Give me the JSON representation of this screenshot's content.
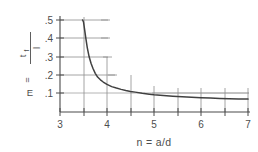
{
  "chart_data": {
    "type": "line",
    "title": "",
    "xlabel": "n = a/d",
    "ylabel": "E = t_f / l",
    "ylabel_parts": {
      "lhs": "E",
      "equals": "=",
      "numerator": "t",
      "numerator_sub": "f",
      "denominator": "l"
    },
    "xlim": [
      3,
      7
    ],
    "ylim": [
      0,
      0.55
    ],
    "grid": true,
    "legend": null,
    "xticks": [
      3,
      4,
      5,
      6,
      7
    ],
    "xtick_labels": [
      "3",
      "4",
      "5",
      "6",
      "7"
    ],
    "xminor_ticks": [
      3.5,
      4.5,
      5.5,
      6.5
    ],
    "yticks": [
      0.1,
      0.2,
      0.3,
      0.4,
      0.5
    ],
    "ytick_labels": [
      ".1",
      ".2",
      ".3",
      ".4",
      ".5"
    ],
    "series": [
      {
        "name": "E vs n",
        "x": [
          3.48,
          3.5,
          3.52,
          3.55,
          3.58,
          3.62,
          3.66,
          3.7,
          3.75,
          3.8,
          3.86,
          3.92,
          4.0,
          4.1,
          4.2,
          4.3,
          4.4,
          4.5,
          4.6,
          4.75,
          4.9,
          5.0,
          5.2,
          5.4,
          5.6,
          5.8,
          6.0,
          6.2,
          6.4,
          6.6,
          6.8,
          7.0
        ],
        "values": [
          0.5,
          0.49,
          0.455,
          0.4,
          0.35,
          0.3,
          0.265,
          0.238,
          0.21,
          0.19,
          0.175,
          0.163,
          0.15,
          0.138,
          0.13,
          0.123,
          0.117,
          0.112,
          0.108,
          0.102,
          0.097,
          0.094,
          0.09,
          0.086,
          0.083,
          0.08,
          0.078,
          0.076,
          0.074,
          0.072,
          0.071,
          0.07
        ]
      }
    ],
    "annotations": []
  },
  "figure": {
    "name": "decay-curve-plot",
    "background_color": "#ffffff",
    "curve_color": "#404040",
    "axis_color": "#4a4a4a",
    "grid_color": "#8d8d8d"
  }
}
